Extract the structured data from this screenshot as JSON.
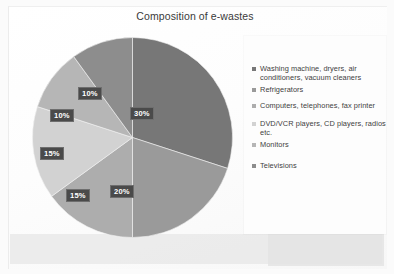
{
  "slide": {
    "title": "Composition of e-wastes"
  },
  "chart_data": {
    "type": "pie",
    "title": "Composition of e-wastes",
    "xlabel": "",
    "ylabel": "",
    "legend_position": "right",
    "grid": false,
    "units": "percent",
    "categories": [
      "Washing machine, dryers, air conditioners, vacuum cleaners",
      "Refrigerators",
      "Computers, telephones, fax printer",
      "DVD/VCR players, CD players, radios etc.",
      "Monitors",
      "Televisions"
    ],
    "values": [
      30,
      20,
      15,
      15,
      10,
      10
    ],
    "data_labels": [
      "30%",
      "20%",
      "15%",
      "15%",
      "10%",
      "10%"
    ],
    "colors": [
      "#777777",
      "#9a9a9a",
      "#adadad",
      "#d2d2d2",
      "#b6b6b6",
      "#8d8d8d"
    ]
  },
  "legend": {
    "items": [
      {
        "label": "Washing machine, dryers, air conditioners, vacuum cleaners",
        "color": "#777777"
      },
      {
        "label": "Refrigerators",
        "color": "#9a9a9a"
      },
      {
        "label": "Computers, telephones, fax printer",
        "color": "#adadad"
      },
      {
        "label": "DVD/VCR players, CD players, radios etc.",
        "color": "#d2d2d2"
      },
      {
        "label": "Monitors",
        "color": "#b6b6b6"
      },
      {
        "label": "Televisions",
        "color": "#8d8d8d"
      }
    ]
  },
  "labels": {
    "slice0": "30%",
    "slice1": "20%",
    "slice2": "15%",
    "slice3": "15%",
    "slice4": "10%",
    "slice5": "10%"
  }
}
